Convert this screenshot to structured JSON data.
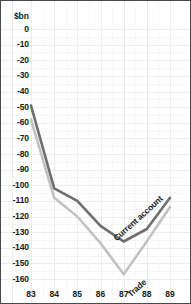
{
  "chart_data": {
    "type": "line",
    "title": "",
    "xlabel": "",
    "ylabel": "$bn",
    "unit_label": "$bn",
    "x": [
      "83",
      "84",
      "85",
      "86",
      "87",
      "88",
      "89"
    ],
    "categories": [
      "83",
      "84",
      "85",
      "86",
      "87",
      "88",
      "89"
    ],
    "ylim": [
      -160,
      0
    ],
    "ytick_labels": [
      "0",
      "-10",
      "-20",
      "-30",
      "-40",
      "-50",
      "-60",
      "-70",
      "-80",
      "-90",
      "-100",
      "-110",
      "-120",
      "-130",
      "-140",
      "-150",
      "-160"
    ],
    "ytick_values": [
      0,
      -10,
      -20,
      -30,
      -40,
      -50,
      -60,
      -70,
      -80,
      -90,
      -100,
      -110,
      -120,
      -130,
      -140,
      -150,
      -160
    ],
    "grid": true,
    "legend_position": "inline-annotations",
    "series": [
      {
        "name": "Current account",
        "color": "#6e6e6e",
        "values": [
          -49,
          -102,
          -110,
          -126,
          -136,
          -128,
          -108
        ]
      },
      {
        "name": "Trade",
        "color": "#c2c2c2",
        "values": [
          -58,
          -108,
          -120,
          -137,
          -157,
          -136,
          -114
        ]
      }
    ],
    "annotations": [
      {
        "text": "Current account",
        "series": "Current account"
      },
      {
        "text": "Trade",
        "series": "Trade"
      }
    ]
  },
  "colors": {
    "current_account": "#6e6e6e",
    "trade": "#c2c2c2",
    "grid": "#ececec",
    "border": "#4a4a4a",
    "text": "#1a1a1a",
    "background": "#ffffff"
  }
}
